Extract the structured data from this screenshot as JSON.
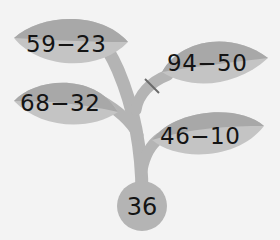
{
  "diagram": {
    "type": "math-plant",
    "leaves": [
      {
        "id": "leaf-top-left",
        "expression": "59−23"
      },
      {
        "id": "leaf-top-right",
        "expression": "94−50",
        "branch_crossed_out": true
      },
      {
        "id": "leaf-middle-left",
        "expression": "68−32"
      },
      {
        "id": "leaf-bottom-right",
        "expression": "46−10"
      }
    ],
    "root": {
      "value": "36"
    },
    "colors": {
      "background": "#f3f3f3",
      "leaf_light": "#c4c4c4",
      "leaf_dark": "#a8a8a8",
      "stem": "#b4b4b4",
      "root_circle": "#b4b4b4",
      "text": "#141414"
    }
  }
}
